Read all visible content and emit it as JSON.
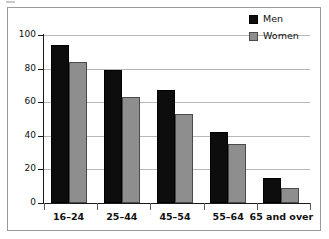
{
  "chart_data": {
    "type": "bar",
    "title": "",
    "subtitle": "",
    "xlabel": "",
    "ylabel": "",
    "ylim": [
      0,
      100
    ],
    "yticks": [
      0,
      20,
      40,
      60,
      80,
      100
    ],
    "grid": true,
    "legend_position": "top-right",
    "categories": [
      "16–24",
      "25–44",
      "45–54",
      "55–64",
      "65 and over"
    ],
    "series": [
      {
        "name": "Men",
        "color": "#0d0d0d",
        "values": [
          94,
          79,
          67,
          42,
          15
        ]
      },
      {
        "name": "Women",
        "color": "#8e8e8e",
        "values": [
          84,
          63,
          53,
          35,
          9
        ]
      }
    ]
  },
  "legend": {
    "items": [
      {
        "label": "Men",
        "swatch": "black-square"
      },
      {
        "label": "Women",
        "swatch": "gray-square"
      }
    ]
  },
  "axis": {
    "y_tick_labels": [
      "0",
      "20",
      "40",
      "60",
      "80",
      "100"
    ],
    "x_tick_labels": [
      "16–24",
      "25–44",
      "45–54",
      "55–64",
      "65 and over"
    ]
  },
  "colors": {
    "men": "#0d0d0d",
    "women": "#8e8e8e",
    "gridline": "#b7b7b7",
    "axis": "#1a1a1a",
    "frame": "#9a9a9a",
    "background": "#ffffff"
  }
}
